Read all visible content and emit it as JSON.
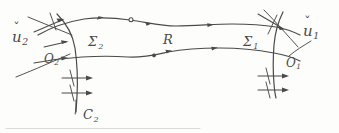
{
  "figure": {
    "kind": "hand-drawn mathematical diagram",
    "width": 339,
    "height": 133,
    "ink_color": "#4a4a4a",
    "background_color": "#fdfdfc"
  },
  "labels": {
    "chart_left": {
      "base": "u",
      "accent": "ˇ",
      "subscript": "2",
      "text": "ǔ₂"
    },
    "chart_right": {
      "base": "u",
      "accent": "ˇ",
      "subscript": "1",
      "text": "ǔ₁"
    },
    "neighborhood_left": {
      "base": "O",
      "subscript": "2",
      "text": "O₂"
    },
    "neighborhood_right": {
      "base": "O",
      "subscript": "1",
      "text": "O₁"
    },
    "section_left": {
      "base": "Σ",
      "subscript": "2",
      "text": "Σ₂"
    },
    "section_right": {
      "base": "Σ",
      "subscript": "1",
      "text": "Σ₁"
    },
    "region": {
      "base": "R",
      "subscript": "",
      "text": "R"
    },
    "curve_bottom": {
      "base": "C",
      "subscript": "2",
      "text": "C₂"
    }
  },
  "strokes": {
    "top_flow_line": "top boundary flow line of region R, left to right",
    "bottom_flow_line": "bottom boundary flow line of region R, left to right",
    "left_cross_section": "arc Σ₂ crossing the tube near the left end",
    "right_cross_section": "arc Σ₁ crossing the tube near the right end",
    "left_chart_line": "straight chart axis line through ǔ₂ region",
    "right_chart_line": "straight chart axis line through ǔ₁ region",
    "left_tick_arrows": "three transversal arrows crossing Σ₂ with tick marks",
    "right_tick_arrows": "three transversal arrows crossing Σ₁ with tick marks",
    "nodes": "two small circle nodes marked on the flow lines",
    "flow_arrowheads": "arrowheads along the top and bottom flow lines pointing right"
  }
}
